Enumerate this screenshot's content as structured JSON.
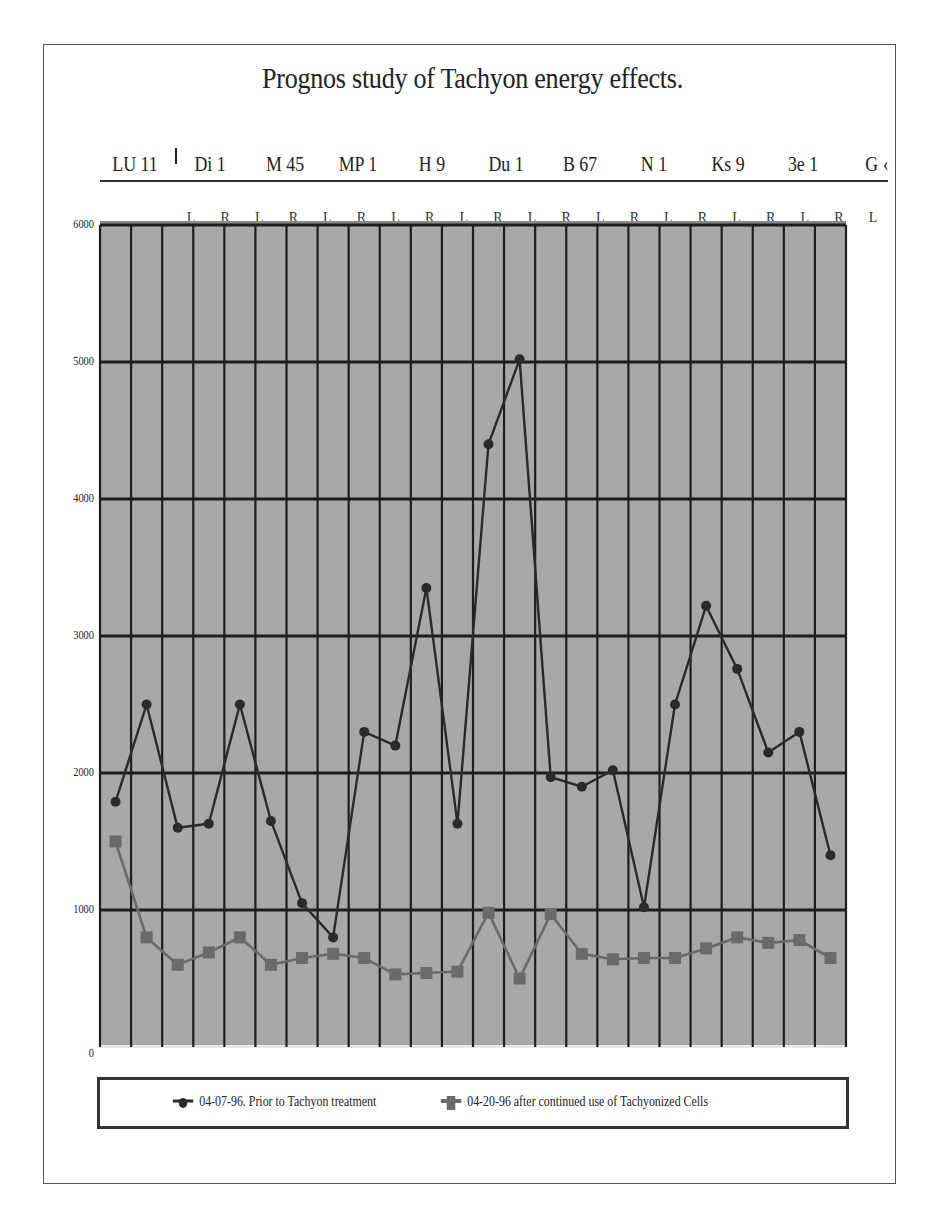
{
  "chart_data": {
    "type": "line",
    "title": "Prognos study of Tachyon energy effects.",
    "group_labels": [
      "LU 11",
      "Di 1",
      "M 45",
      "MP 1",
      "H 9",
      "Du 1",
      "B 67",
      "N 1",
      "Ks 9",
      "3e 1",
      "G ‹"
    ],
    "side_labels": [
      "L",
      "R",
      "L",
      "R",
      "L",
      "R",
      "L",
      "R",
      "L",
      "R",
      "L",
      "R",
      "L",
      "R",
      "L",
      "R",
      "L",
      "R",
      "L",
      "R",
      "L"
    ],
    "categories": [
      "1",
      "2",
      "3",
      "4",
      "5",
      "6",
      "7",
      "8",
      "9",
      "10",
      "11",
      "12",
      "13",
      "14",
      "15",
      "16",
      "17",
      "18",
      "19",
      "20",
      "21",
      "22",
      "23",
      "24"
    ],
    "series": [
      {
        "name": "04-07-96. Prior to Tachyon treatment",
        "color": "#2a2a2a",
        "marker": "circle",
        "values": [
          1790,
          2500,
          1600,
          1630,
          2500,
          1650,
          1050,
          800,
          2300,
          2200,
          3350,
          1630,
          4400,
          5020,
          1970,
          1900,
          2020,
          1020,
          2500,
          3220,
          2760,
          2150,
          2300,
          1400
        ]
      },
      {
        "name": "04-20-96 after continued use of Tachyonized Cells",
        "color": "#6a6a6a",
        "marker": "square",
        "values": [
          1500,
          800,
          600,
          690,
          800,
          600,
          650,
          680,
          650,
          530,
          540,
          550,
          980,
          500,
          970,
          680,
          640,
          650,
          650,
          720,
          800,
          760,
          780,
          650
        ]
      }
    ],
    "xlabel": "",
    "ylabel": "",
    "ylim": [
      0,
      6000
    ],
    "yticks": [
      0,
      1000,
      2000,
      3000,
      4000,
      5000,
      6000
    ],
    "grid": true,
    "legend_position": "bottom",
    "plot_background": "#a8a8a8"
  }
}
